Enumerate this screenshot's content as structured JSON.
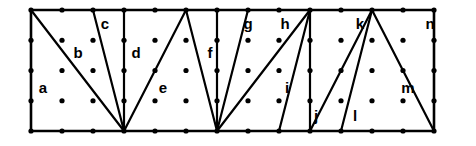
{
  "figure": {
    "kind": "lattice-triangulation-diagram",
    "background_color": "#ffffff",
    "ink_color": "#000000",
    "width": 476,
    "height": 146
  },
  "lattice": {
    "origin_x": 31,
    "origin_y": 10,
    "step_x": 31,
    "step_y": 30.25,
    "columns": 14,
    "rows": 5,
    "dot_radius": 2.6,
    "column_positions": [
      31,
      62,
      93,
      124,
      155,
      186,
      217,
      248,
      279,
      310,
      341,
      372,
      403,
      434
    ],
    "row_positions": [
      10,
      40.25,
      70.5,
      100.75,
      131
    ]
  },
  "boundary": {
    "label": "outer-rectangle",
    "left": 31,
    "top": 10,
    "right": 434,
    "bottom": 131,
    "points": "31,10 434,10 434,131 31,131"
  },
  "interior_edges": [
    {
      "name": "edge-a-b",
      "x1": 31,
      "y1": 10,
      "x2": 124,
      "y2": 131
    },
    {
      "name": "edge-b-c",
      "x1": 93,
      "y1": 10,
      "x2": 124,
      "y2": 131
    },
    {
      "name": "edge-c-d",
      "x1": 124,
      "y1": 10,
      "x2": 124,
      "y2": 131
    },
    {
      "name": "edge-d-e",
      "x1": 186,
      "y1": 10,
      "x2": 124,
      "y2": 131
    },
    {
      "name": "edge-e-f",
      "x1": 186,
      "y1": 10,
      "x2": 217,
      "y2": 131
    },
    {
      "name": "edge-f-g",
      "x1": 217,
      "y1": 10,
      "x2": 217,
      "y2": 131
    },
    {
      "name": "edge-g-h",
      "x1": 248,
      "y1": 10,
      "x2": 217,
      "y2": 131
    },
    {
      "name": "edge-h-i",
      "x1": 310,
      "y1": 10,
      "x2": 217,
      "y2": 131
    },
    {
      "name": "edge-i-j",
      "x1": 310,
      "y1": 10,
      "x2": 279,
      "y2": 131
    },
    {
      "name": "edge-j-k",
      "x1": 310,
      "y1": 10,
      "x2": 310,
      "y2": 131
    },
    {
      "name": "edge-k-l",
      "x1": 372,
      "y1": 10,
      "x2": 310,
      "y2": 131
    },
    {
      "name": "edge-l-m",
      "x1": 372,
      "y1": 10,
      "x2": 341,
      "y2": 131
    },
    {
      "name": "edge-m-n",
      "x1": 372,
      "y1": 10,
      "x2": 434,
      "y2": 131
    }
  ],
  "regions": [
    {
      "id": "a",
      "label": "a",
      "x": 43,
      "y": 89
    },
    {
      "id": "b",
      "label": "b",
      "x": 78,
      "y": 54
    },
    {
      "id": "c",
      "label": "c",
      "x": 105,
      "y": 25
    },
    {
      "id": "d",
      "label": "d",
      "x": 136,
      "y": 54
    },
    {
      "id": "e",
      "label": "e",
      "x": 163,
      "y": 89
    },
    {
      "id": "f",
      "label": "f",
      "x": 210,
      "y": 54
    },
    {
      "id": "g",
      "label": "g",
      "x": 248,
      "y": 25
    },
    {
      "id": "h",
      "label": "h",
      "x": 285,
      "y": 25
    },
    {
      "id": "i",
      "label": "i",
      "x": 287,
      "y": 89
    },
    {
      "id": "j",
      "label": "j",
      "x": 316,
      "y": 117
    },
    {
      "id": "k",
      "label": "k",
      "x": 360,
      "y": 25
    },
    {
      "id": "l",
      "label": "l",
      "x": 355,
      "y": 117
    },
    {
      "id": "m",
      "label": "m",
      "x": 408,
      "y": 89
    },
    {
      "id": "n",
      "label": "n",
      "x": 430,
      "y": 25
    }
  ]
}
